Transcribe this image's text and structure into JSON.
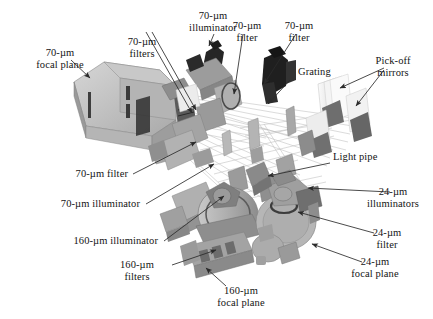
{
  "figure": {
    "type": "technical-diagram",
    "background_color": "#ffffff",
    "render_style": "grayscale 3D CAD rendering with ray-trace lines",
    "width": 433,
    "height": 319
  },
  "labels": [
    {
      "id": "focal-plane-70-left",
      "line1": "70-µm",
      "line2": "focal plane",
      "align": "center"
    },
    {
      "id": "filters-70-top",
      "line1": "70-µm",
      "line2": "filters",
      "align": "center"
    },
    {
      "id": "illuminator-70-top",
      "line1": "70-µm",
      "line2": "illuminator",
      "align": "center"
    },
    {
      "id": "filter-70-topmid",
      "line1": "70-µm",
      "line2": "filter",
      "align": "center"
    },
    {
      "id": "filter-70-topright",
      "line1": "70-µm",
      "line2": "filter",
      "align": "center"
    },
    {
      "id": "grating",
      "line1": "Grating",
      "line2": "",
      "align": "left"
    },
    {
      "id": "pick-off-mirrors",
      "line1": "Pick-off",
      "line2": "mirrors",
      "align": "center"
    },
    {
      "id": "light-pipe",
      "line1": "Light pipe",
      "line2": "",
      "align": "left"
    },
    {
      "id": "filter-70-mid",
      "line1": "70-µm filter",
      "line2": "",
      "align": "right"
    },
    {
      "id": "illuminator-70-mid",
      "line1": "70-µm illuminator",
      "line2": "",
      "align": "right"
    },
    {
      "id": "illuminator-160",
      "line1": "160-µm illuminator",
      "line2": "",
      "align": "right"
    },
    {
      "id": "filters-160",
      "line1": "160-µm",
      "line2": "filters",
      "align": "center"
    },
    {
      "id": "focal-plane-160",
      "line1": "160-µm",
      "line2": "focal plane",
      "align": "center"
    },
    {
      "id": "illuminators-24",
      "line1": "24-µm",
      "line2": "illuminators",
      "align": "center"
    },
    {
      "id": "filter-24",
      "line1": "24-µm",
      "line2": "filter",
      "align": "center"
    },
    {
      "id": "focal-plane-24",
      "line1": "24-µm",
      "line2": "focal plane",
      "align": "center"
    }
  ],
  "colors": {
    "text": "#141414",
    "leader_line": "#2b2b2b",
    "ray_line": "#b9b9b9",
    "body_light": "#cfcfcf",
    "body_mid": "#a8a8a8",
    "body_dark": "#7d7d7d",
    "body_darkest": "#3a3a3a",
    "background": "#ffffff"
  }
}
